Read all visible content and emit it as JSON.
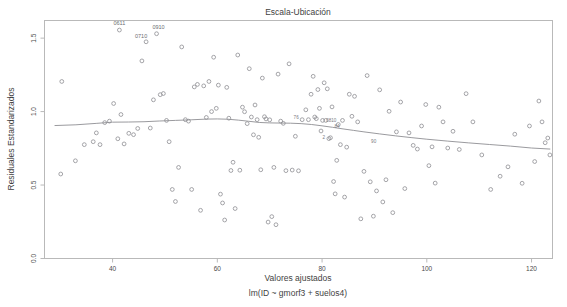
{
  "chart_data": {
    "type": "scatter",
    "title": "Escala-Ubicación",
    "xlabel": "Valores ajustados",
    "sublabel": "lm(ID ~ gmorf3 + suelos4)",
    "ylabel": "Residuales Estandarizados",
    "xlim": [
      27,
      124
    ],
    "ylim": [
      0.0,
      1.62
    ],
    "grid": false,
    "legend": "none",
    "xticks": [
      40,
      60,
      80,
      100,
      120
    ],
    "xtick_labels": [
      "40",
      "60",
      "80",
      "100",
      "120"
    ],
    "yticks": [
      0.0,
      0.5,
      1.0,
      1.5
    ],
    "ytick_labels": [
      "0.0",
      "0.5",
      "1.0",
      "1.5"
    ],
    "point_marker": "open-circle",
    "point_color": "#8e8e93",
    "smoother_color": "#8e8e93",
    "x": [
      30.1,
      30.3,
      32.9,
      34.6,
      36.3,
      36.9,
      37.6,
      38.5,
      39.4,
      40.2,
      41.0,
      41.3,
      41.6,
      42.2,
      43.1,
      44.0,
      44.8,
      45.6,
      46.4,
      47.2,
      47.8,
      48.4,
      49.1,
      49.7,
      50.3,
      50.8,
      51.4,
      52.0,
      52.6,
      53.2,
      53.9,
      54.5,
      55.1,
      55.6,
      56.2,
      56.8,
      57.4,
      57.9,
      58.4,
      58.9,
      59.3,
      59.8,
      60.2,
      60.6,
      61.0,
      61.4,
      61.8,
      62.2,
      62.6,
      63.0,
      63.4,
      63.9,
      64.3,
      64.8,
      65.2,
      65.7,
      66.1,
      66.5,
      66.9,
      67.2,
      67.6,
      67.9,
      68.3,
      68.6,
      69.0,
      69.3,
      69.7,
      70.0,
      70.4,
      70.8,
      71.2,
      71.6,
      72.1,
      72.6,
      73.1,
      73.7,
      74.3,
      74.9,
      75.5,
      76.2,
      76.9,
      77.4,
      77.9,
      78.3,
      78.6,
      78.9,
      79.2,
      79.5,
      79.8,
      80.1,
      80.4,
      80.7,
      81.0,
      81.3,
      81.6,
      81.9,
      82.2,
      82.5,
      82.8,
      83.1,
      83.5,
      83.9,
      84.3,
      84.7,
      85.2,
      85.7,
      86.2,
      86.8,
      87.4,
      88.0,
      88.6,
      89.2,
      89.8,
      90.4,
      91.0,
      91.6,
      92.2,
      92.8,
      93.5,
      94.2,
      95.0,
      95.8,
      96.6,
      97.4,
      98.2,
      99.0,
      99.8,
      100.4,
      101.0,
      101.6,
      102.3,
      103.1,
      104.0,
      105.0,
      106.2,
      107.5,
      108.8,
      110.5,
      112.2,
      114.0,
      115.5,
      116.8,
      118.2,
      119.6,
      120.6,
      121.4,
      122.0,
      122.6,
      123.1,
      123.5
    ],
    "y": [
      0.575,
      1.205,
      0.665,
      0.775,
      0.795,
      0.855,
      0.775,
      0.925,
      0.935,
      1.055,
      0.815,
      1.555,
      0.98,
      0.78,
      0.852,
      0.843,
      0.885,
      1.345,
      1.475,
      0.888,
      1.08,
      1.53,
      1.115,
      1.123,
      0.94,
      0.795,
      0.47,
      0.388,
      0.62,
      1.44,
      0.945,
      0.935,
      0.47,
      1.168,
      1.185,
      0.328,
      1.175,
      0.96,
      1.205,
      1.0,
      1.37,
      1.022,
      1.18,
      0.438,
      0.378,
      0.262,
      1.165,
      0.955,
      0.599,
      0.655,
      0.34,
      1.385,
      0.601,
      1.03,
      0.999,
      0.918,
      1.292,
      0.963,
      0.842,
      1.045,
      0.945,
      0.825,
      0.604,
      1.228,
      0.965,
      0.95,
      0.248,
      0.944,
      0.285,
      0.62,
      0.23,
      1.255,
      0.935,
      0.92,
      0.598,
      1.325,
      0.602,
      0.832,
      0.597,
      0.945,
      1.012,
      0.945,
      1.118,
      1.24,
      0.963,
      0.952,
      1.15,
      1.022,
      0.868,
      0.94,
      1.196,
      0.94,
      1.155,
      0.816,
      0.822,
      1.032,
      0.524,
      0.44,
      0.668,
      0.912,
      0.775,
      0.94,
      0.418,
      0.758,
      1.118,
      0.968,
      1.104,
      0.93,
      0.27,
      0.593,
      1.245,
      0.522,
      0.288,
      0.46,
      1.148,
      0.385,
      0.536,
      1.002,
      0.312,
      0.862,
      1.065,
      0.476,
      0.855,
      0.77,
      0.745,
      0.902,
      1.048,
      0.632,
      0.76,
      0.513,
      1.03,
      0.93,
      0.752,
      0.866,
      0.742,
      1.122,
      0.93,
      0.705,
      0.47,
      0.56,
      0.624,
      0.846,
      0.512,
      0.902,
      0.66,
      1.072,
      0.93,
      0.788,
      0.82,
      0.705
    ],
    "smoother_x": [
      29.0,
      33.0,
      37.0,
      40.0,
      43.0,
      46.0,
      49.0,
      52.0,
      55.0,
      58.0,
      60.0,
      62.0,
      64.0,
      66.0,
      68.0,
      70.0,
      72.0,
      74.0,
      76.0,
      78.0,
      80.0,
      82.0,
      84.0,
      86.0,
      88.0,
      91.0,
      94.0,
      97.0,
      100.0,
      104.0,
      108.0,
      112.0,
      116.0,
      120.0,
      123.5
    ],
    "smoother_y": [
      0.905,
      0.91,
      0.92,
      0.928,
      0.929,
      0.931,
      0.936,
      0.94,
      0.944,
      0.949,
      0.95,
      0.948,
      0.942,
      0.934,
      0.926,
      0.923,
      0.922,
      0.921,
      0.918,
      0.912,
      0.903,
      0.893,
      0.882,
      0.872,
      0.862,
      0.848,
      0.835,
      0.823,
      0.812,
      0.799,
      0.787,
      0.776,
      0.765,
      0.752,
      0.745
    ],
    "outlier_labels": [
      {
        "text": "0611",
        "x": 41.3,
        "y": 1.555,
        "dx": 0,
        "dy": -5
      },
      {
        "text": "0910",
        "x": 48.4,
        "y": 1.53,
        "dx": 2,
        "dy": -5
      },
      {
        "text": "0710",
        "x": 46.4,
        "y": 1.475,
        "dx": -5,
        "dy": -4
      }
    ],
    "inline_labels": [
      {
        "text": "76",
        "x": 76.2,
        "y": 0.945,
        "dx": -6,
        "dy": -1
      },
      {
        "text": "2",
        "x": 81.3,
        "y": 0.816,
        "dx": -5,
        "dy": 0
      },
      {
        "text": "0810",
        "x": 81.0,
        "y": 0.94,
        "dx": 4,
        "dy": 2
      },
      {
        "text": "90",
        "x": 91.0,
        "y": 0.79,
        "dx": -6,
        "dy": 1
      },
      {
        "text": "84",
        "x": 84.0,
        "y": 0.89,
        "dx": -6,
        "dy": 0
      }
    ]
  }
}
